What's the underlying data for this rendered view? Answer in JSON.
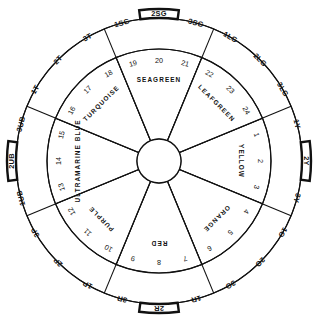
{
  "diagram": {
    "type": "24-step hue circle",
    "center": {
      "x": 159,
      "y": 161
    },
    "radii": {
      "hub": 22,
      "inner_ring": 112,
      "outer_ring": 143,
      "chip_bulge": 152
    },
    "stroke_color": "#111111",
    "background_color": "#ffffff",
    "emphasized_chips": [
      "2SG",
      "2Y",
      "2R",
      "2UB"
    ],
    "hues": [
      {
        "name": "YELLOW",
        "label_angle": 0,
        "start_angle": -22.5,
        "end_angle": 22.5,
        "numbers": [
          "1",
          "2",
          "3"
        ],
        "chips": [
          "1Y",
          "2Y",
          "3Y"
        ]
      },
      {
        "name": "ORANGE",
        "label_angle": 45,
        "start_angle": 22.5,
        "end_angle": 67.5,
        "numbers": [
          "4",
          "5",
          "6"
        ],
        "chips": [
          "1O",
          "2O",
          "3O"
        ]
      },
      {
        "name": "RED",
        "label_angle": 90,
        "start_angle": 67.5,
        "end_angle": 112.5,
        "numbers": [
          "7",
          "8",
          "9"
        ],
        "chips": [
          "1R",
          "2R",
          "3R"
        ]
      },
      {
        "name": "PURPLE",
        "label_angle": 135,
        "start_angle": 112.5,
        "end_angle": 157.5,
        "numbers": [
          "10",
          "11",
          "12"
        ],
        "chips": [
          "1P",
          "2P",
          "3P"
        ]
      },
      {
        "name": "ULTRAMARINE BLUE",
        "label_angle": 180,
        "start_angle": 157.5,
        "end_angle": 202.5,
        "numbers": [
          "13",
          "14",
          "15"
        ],
        "chips": [
          "1UB",
          "2UB",
          "3UB"
        ]
      },
      {
        "name": "TURQUOISE",
        "label_angle": 225,
        "start_angle": 202.5,
        "end_angle": 247.5,
        "numbers": [
          "16",
          "17",
          "18"
        ],
        "chips": [
          "1T",
          "2T",
          "3T"
        ]
      },
      {
        "name": "SEAGREEN",
        "label_angle": 270,
        "start_angle": 247.5,
        "end_angle": 292.5,
        "numbers": [
          "19",
          "20",
          "21"
        ],
        "chips": [
          "1SG",
          "2SG",
          "3SG"
        ]
      },
      {
        "name": "LEAFGREEN",
        "label_angle": 315,
        "start_angle": 292.5,
        "end_angle": 337.5,
        "numbers": [
          "22",
          "23",
          "24"
        ],
        "chips": [
          "1LG",
          "2LG",
          "3LG"
        ]
      }
    ]
  }
}
